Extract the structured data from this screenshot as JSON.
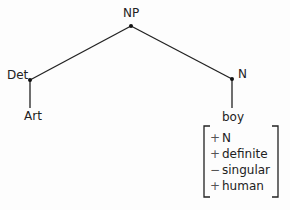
{
  "tree": {
    "root": {
      "label": "NP"
    },
    "left": {
      "label": "Det",
      "child": "Art"
    },
    "right": {
      "label": "N",
      "child": "boy"
    }
  },
  "features": [
    {
      "sign": "+",
      "name": "N"
    },
    {
      "sign": "+",
      "name": "definite"
    },
    {
      "sign": "−",
      "name": "singular"
    },
    {
      "sign": "+",
      "name": "human"
    }
  ]
}
